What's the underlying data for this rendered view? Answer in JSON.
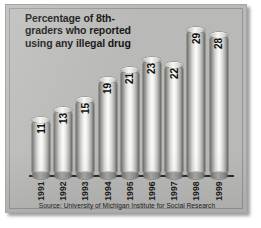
{
  "chart_data": {
    "type": "bar",
    "title": "Percentage of 8th-\ngraders who reported\nusing any illegal drug",
    "xlabel": "",
    "ylabel": "",
    "ylim": [
      0,
      30
    ],
    "grid": false,
    "legend": "none",
    "categories": [
      "1991",
      "1992",
      "1993",
      "1994",
      "1995",
      "1996",
      "1997",
      "1998",
      "1999"
    ],
    "values": [
      11,
      13,
      15,
      19,
      21,
      23,
      22,
      29,
      28
    ],
    "value_labels": [
      "11",
      "13",
      "15",
      "19",
      "21",
      "23",
      "22",
      "29",
      "28"
    ],
    "source": "Source: University of Michigan Institute for Social Research",
    "orientation": "vertical",
    "bar_style": "3d-cylinder",
    "label_rotation": -90
  },
  "colors": {
    "panel_background": "#b9b9b7",
    "page_background": "#ffffff",
    "axis": "#2c2c2c",
    "title_text": "#131313",
    "label_text": "#1b1b1b",
    "source_text": "#202020",
    "bar_highlight": "#fbfbf8",
    "bar_shadow": "#63635f"
  }
}
